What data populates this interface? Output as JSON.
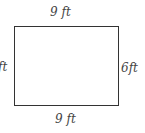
{
  "diagram": {
    "shape": "rectangle",
    "labels": {
      "top": "9 ft",
      "bottom": "9 ft",
      "left": "ft",
      "right": "6ft"
    },
    "stroke_color": "#333333"
  }
}
